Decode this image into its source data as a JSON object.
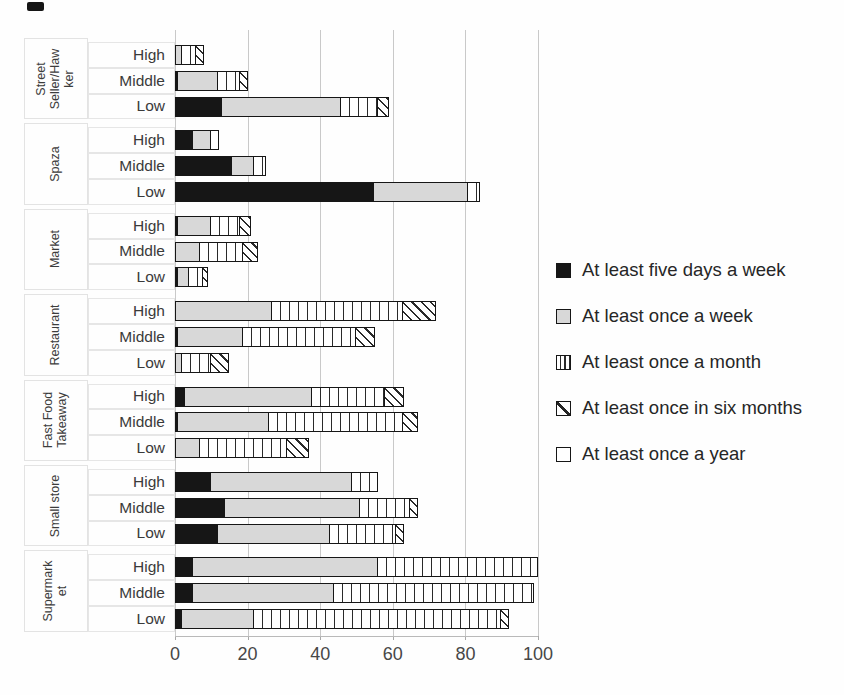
{
  "chart_data": {
    "type": "bar",
    "orientation": "horizontal-stacked",
    "title": "",
    "xlabel": "",
    "ylabel": "",
    "xlim": [
      0,
      100
    ],
    "x_ticks": [
      0,
      20,
      40,
      60,
      80,
      100
    ],
    "grid": "vertical-on",
    "legend_position": "right",
    "series_names": [
      "At least five days a week",
      "At least once a week",
      "At least once a month",
      "At least once in six months",
      "At least once a year"
    ],
    "row_order_note": "values arrays follow series_names order",
    "groups": [
      {
        "category": "Street Seller/Hawker",
        "rows": [
          {
            "label": "High",
            "values": [
              0,
              2,
              4,
              2,
              0
            ]
          },
          {
            "label": "Middle",
            "values": [
              1,
              11,
              6,
              2,
              0
            ]
          },
          {
            "label": "Low",
            "values": [
              13,
              33,
              10,
              3,
              0
            ]
          }
        ]
      },
      {
        "category": "Spaza",
        "rows": [
          {
            "label": "High",
            "values": [
              5,
              5,
              2,
              0,
              0
            ]
          },
          {
            "label": "Middle",
            "values": [
              16,
              6,
              3,
              0,
              0
            ]
          },
          {
            "label": "Low",
            "values": [
              55,
              26,
              3,
              0,
              0
            ]
          }
        ]
      },
      {
        "category": "Market",
        "rows": [
          {
            "label": "High",
            "values": [
              1,
              9,
              8,
              3,
              0
            ]
          },
          {
            "label": "Middle",
            "values": [
              0,
              7,
              12,
              4,
              0
            ]
          },
          {
            "label": "Low",
            "values": [
              1,
              3,
              4,
              1,
              0
            ]
          }
        ]
      },
      {
        "category": "Restaurant",
        "rows": [
          {
            "label": "High",
            "values": [
              0,
              27,
              36,
              9,
              0
            ]
          },
          {
            "label": "Middle",
            "values": [
              1,
              18,
              31,
              5,
              0
            ]
          },
          {
            "label": "Low",
            "values": [
              0,
              2,
              8,
              5,
              0
            ]
          }
        ]
      },
      {
        "category": "Fast Food Takeaway",
        "rows": [
          {
            "label": "High",
            "values": [
              3,
              35,
              20,
              5,
              0
            ]
          },
          {
            "label": "Middle",
            "values": [
              1,
              25,
              37,
              4,
              0
            ]
          },
          {
            "label": "Low",
            "values": [
              0,
              7,
              24,
              6,
              0
            ]
          }
        ]
      },
      {
        "category": "Small store",
        "rows": [
          {
            "label": "High",
            "values": [
              10,
              39,
              7,
              0,
              0
            ]
          },
          {
            "label": "Middle",
            "values": [
              14,
              37,
              14,
              2,
              0
            ]
          },
          {
            "label": "Low",
            "values": [
              12,
              31,
              18,
              2,
              0
            ]
          }
        ]
      },
      {
        "category": "Supermarket",
        "rows": [
          {
            "label": "High",
            "values": [
              5,
              51,
              44,
              0,
              0
            ]
          },
          {
            "label": "Middle",
            "values": [
              5,
              39,
              55,
              0,
              0
            ]
          },
          {
            "label": "Low",
            "values": [
              2,
              20,
              68,
              2,
              0
            ]
          }
        ]
      }
    ]
  },
  "legend": {
    "items": [
      {
        "label": "At least five days a week",
        "pattern": "five"
      },
      {
        "label": "At least once a week",
        "pattern": "week"
      },
      {
        "label": "At least once a month",
        "pattern": "month"
      },
      {
        "label": "At least once in six months",
        "pattern": "six"
      },
      {
        "label": "At least once a year",
        "pattern": "year"
      }
    ]
  },
  "colors": {
    "series_black": "#161616",
    "series_gray": "#d8d8d8",
    "pattern_line": "#2a2a2a",
    "gridline": "#c9c9c9",
    "text": "#3a3a3a",
    "background": "#fefefe"
  }
}
